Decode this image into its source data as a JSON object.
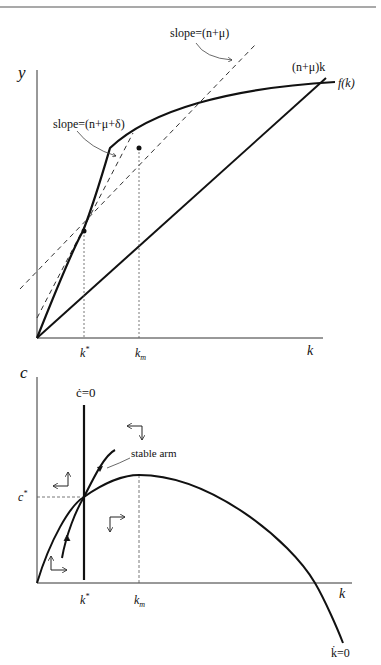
{
  "top_panel": {
    "y_axis_label": "y",
    "x_axis_label": "k",
    "curve_label": "f(k)",
    "line_label": "(n+μ)k",
    "tangent1_label": "slope=(n+μ)",
    "tangent2_label": "slope=(n+μ+δ)",
    "tick_kstar": "k*",
    "tick_km": "km"
  },
  "bottom_panel": {
    "y_axis_label": "c",
    "x_axis_label": "k",
    "cdot_label": "ċ=0",
    "kdot_label": "k̇=0",
    "stable_arm_label": "stable arm",
    "tick_cstar": "c*",
    "tick_kstar": "k*",
    "tick_km": "km"
  },
  "colors": {
    "line": "#111111",
    "guide": "#555555",
    "background": "#ffffff"
  }
}
